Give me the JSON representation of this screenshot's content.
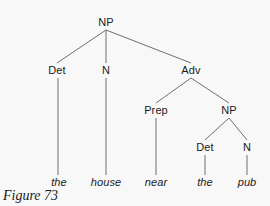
{
  "figure": {
    "caption": "Figure 73",
    "background_color": "#f8f8f8",
    "line_color": "#6e6e6e",
    "text_color": "#1b1b1b"
  },
  "tree": {
    "type": "syntax-tree",
    "sentence": "the house near the pub",
    "nodes": [
      {
        "id": "np-root",
        "label": "NP",
        "x": 106,
        "y": 22,
        "kind": "nonterminal"
      },
      {
        "id": "det-1",
        "label": "Det",
        "x": 57,
        "y": 70,
        "kind": "nonterminal"
      },
      {
        "id": "n-1",
        "label": "N",
        "x": 106,
        "y": 70,
        "kind": "nonterminal"
      },
      {
        "id": "adv-1",
        "label": "Adv",
        "x": 191,
        "y": 70,
        "kind": "nonterminal"
      },
      {
        "id": "prep-1",
        "label": "Prep",
        "x": 156,
        "y": 110,
        "kind": "nonterminal"
      },
      {
        "id": "np-2",
        "label": "NP",
        "x": 229,
        "y": 110,
        "kind": "nonterminal"
      },
      {
        "id": "det-2",
        "label": "Det",
        "x": 205,
        "y": 147,
        "kind": "nonterminal"
      },
      {
        "id": "n-2",
        "label": "N",
        "x": 247,
        "y": 147,
        "kind": "nonterminal"
      }
    ],
    "leaves": [
      {
        "id": "leaf-the-1",
        "label": "the",
        "x": 59,
        "y": 182,
        "parent": "det-1"
      },
      {
        "id": "leaf-house",
        "label": "house",
        "x": 106,
        "y": 182,
        "parent": "n-1"
      },
      {
        "id": "leaf-near",
        "label": "near",
        "x": 156,
        "y": 182,
        "parent": "prep-1"
      },
      {
        "id": "leaf-the-2",
        "label": "the",
        "x": 205,
        "y": 182,
        "parent": "det-2"
      },
      {
        "id": "leaf-pub",
        "label": "pub",
        "x": 247,
        "y": 182,
        "parent": "n-2"
      }
    ],
    "edges": [
      {
        "from": "np-root",
        "to": "det-1",
        "x1": 106,
        "y1": 30,
        "x2": 57,
        "y2": 63
      },
      {
        "from": "np-root",
        "to": "n-1",
        "x1": 106,
        "y1": 30,
        "x2": 106,
        "y2": 63
      },
      {
        "from": "np-root",
        "to": "adv-1",
        "x1": 106,
        "y1": 30,
        "x2": 191,
        "y2": 63
      },
      {
        "from": "adv-1",
        "to": "prep-1",
        "x1": 191,
        "y1": 78,
        "x2": 156,
        "y2": 103
      },
      {
        "from": "adv-1",
        "to": "np-2",
        "x1": 191,
        "y1": 78,
        "x2": 229,
        "y2": 103
      },
      {
        "from": "np-2",
        "to": "det-2",
        "x1": 229,
        "y1": 118,
        "x2": 205,
        "y2": 140
      },
      {
        "from": "np-2",
        "to": "n-2",
        "x1": 229,
        "y1": 118,
        "x2": 247,
        "y2": 140
      },
      {
        "from": "det-1",
        "to": "leaf-the-1",
        "x1": 58,
        "y1": 78,
        "x2": 58,
        "y2": 175
      },
      {
        "from": "n-1",
        "to": "leaf-house",
        "x1": 106,
        "y1": 78,
        "x2": 106,
        "y2": 175
      },
      {
        "from": "prep-1",
        "to": "leaf-near",
        "x1": 156,
        "y1": 118,
        "x2": 156,
        "y2": 175
      },
      {
        "from": "det-2",
        "to": "leaf-the-2",
        "x1": 205,
        "y1": 155,
        "x2": 205,
        "y2": 175
      },
      {
        "from": "n-2",
        "to": "leaf-pub",
        "x1": 247,
        "y1": 155,
        "x2": 247,
        "y2": 175
      }
    ]
  }
}
